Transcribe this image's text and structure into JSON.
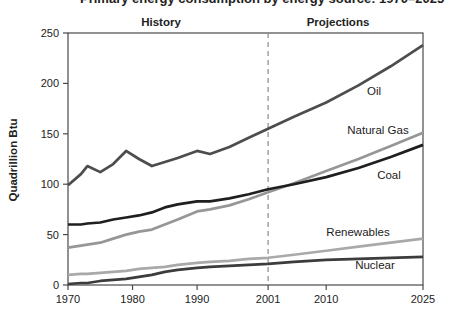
{
  "page": {
    "title": "Primary energy consumption by energy source: 1970–2025"
  },
  "chart_data": {
    "type": "line",
    "title": "Primary energy consumption by energy source: 1970–2025",
    "ylabel": "Quadrillion Btu",
    "region_labels": {
      "history": "History",
      "projections": "Projections"
    },
    "divider_year": 2001,
    "xlim": [
      1970,
      2025
    ],
    "ylim": [
      0,
      250
    ],
    "x_ticks": [
      1970,
      1980,
      1990,
      2001,
      2010,
      2025
    ],
    "y_ticks": [
      0,
      50,
      100,
      150,
      200,
      250
    ],
    "grid": false,
    "legend": "inline-labels",
    "x": [
      1970,
      1972,
      1973,
      1975,
      1977,
      1979,
      1981,
      1983,
      1985,
      1987,
      1990,
      1992,
      1995,
      1998,
      2001,
      2005,
      2010,
      2015,
      2020,
      2025
    ],
    "series": [
      {
        "name": "Oil",
        "color": "#4d4d4d",
        "values": [
          99,
          110,
          118,
          112,
          120,
          133,
          125,
          118,
          122,
          126,
          133,
          130,
          137,
          146,
          155,
          167,
          181,
          198,
          217,
          238
        ]
      },
      {
        "name": "Natural Gas",
        "color": "#969696",
        "values": [
          37,
          39,
          40,
          42,
          46,
          50,
          53,
          55,
          60,
          65,
          73,
          75,
          79,
          85,
          92,
          101,
          113,
          125,
          138,
          151
        ]
      },
      {
        "name": "Coal",
        "color": "#1f1f1f",
        "values": [
          60,
          60,
          61,
          62,
          65,
          67,
          69,
          72,
          77,
          80,
          83,
          83,
          86,
          90,
          95,
          100,
          107,
          116,
          127,
          139
        ]
      },
      {
        "name": "Renewables",
        "color": "#a9a9a9",
        "values": [
          10,
          11,
          11,
          12,
          13,
          14,
          16,
          17,
          18,
          20,
          22,
          23,
          24,
          26,
          27,
          30,
          34,
          38,
          42,
          46
        ]
      },
      {
        "name": "Nuclear",
        "color": "#3c3c3c",
        "values": [
          1,
          2,
          2,
          4,
          5,
          6,
          8,
          10,
          13,
          15,
          17,
          18,
          19,
          20,
          21,
          23,
          25,
          26,
          27,
          28
        ]
      }
    ]
  }
}
